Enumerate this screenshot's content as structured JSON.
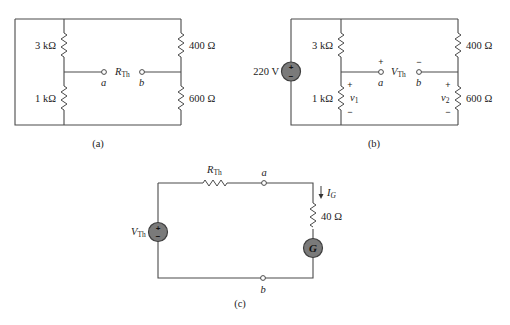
{
  "figure": {
    "panels": [
      {
        "id": "a",
        "caption": "(a)",
        "resistors": {
          "top_left": "3 kΩ",
          "bottom_left": "1 kΩ",
          "top_right": "400 Ω",
          "bottom_right": "600 Ω"
        },
        "terminals": {
          "a": "a",
          "b": "b"
        },
        "between_label": {
          "main": "R",
          "sub": "Th"
        }
      },
      {
        "id": "b",
        "caption": "(b)",
        "source": {
          "value": "220 V",
          "plus": "+",
          "minus": "−"
        },
        "resistors": {
          "top_left": "3 kΩ",
          "bottom_left": "1 kΩ",
          "top_right": "400 Ω",
          "bottom_right": "600 Ω"
        },
        "voltages": {
          "v1": {
            "main": "v",
            "sub": "1",
            "plus": "+",
            "minus": "−"
          },
          "v2": {
            "main": "v",
            "sub": "2",
            "plus": "+",
            "minus": "−"
          }
        },
        "terminals": {
          "a": "a",
          "b": "b",
          "a_sign": "+",
          "b_sign": "−"
        },
        "between_label": {
          "main": "V",
          "sub": "Th"
        }
      },
      {
        "id": "c",
        "caption": "(c)",
        "source": {
          "main": "V",
          "sub": "Th",
          "plus": "+",
          "minus": "−"
        },
        "series_resistor": {
          "main": "R",
          "sub": "Th"
        },
        "load_resistor": "40 Ω",
        "current": {
          "main": "I",
          "sub": "G"
        },
        "galvanometer": "G",
        "terminals": {
          "a": "a",
          "b": "b"
        }
      }
    ],
    "colors": {
      "wire": "#4a4a4a",
      "source_fill": "#7a7a7a",
      "background": "#ffffff"
    }
  }
}
